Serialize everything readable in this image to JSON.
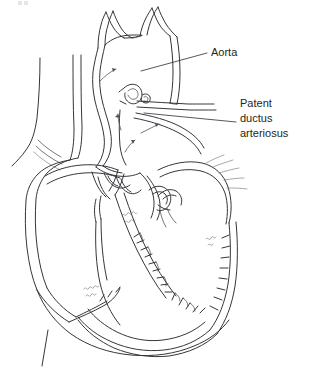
{
  "figure": {
    "title": "Patent ductus arteriosus",
    "kind": "anatomical-line-drawing",
    "background_color": "#ffffff",
    "ink_color": "#37353a",
    "label_color": "#231f20",
    "width": 311,
    "height": 369
  },
  "labels": [
    {
      "id": "aorta",
      "lines": [
        "Aorta"
      ],
      "text": "Aorta",
      "x": 211,
      "y": 53,
      "leader_from": [
        141,
        71
      ],
      "leader_to": [
        207,
        53
      ]
    },
    {
      "id": "patent-ductus-arteriosus",
      "lines": [
        "Patent",
        "ductus",
        "arteriosus"
      ],
      "text": "Patent ductus arteriosus",
      "x": 240,
      "y": 104,
      "leader_from": [
        144,
        113
      ],
      "leader_to": [
        236,
        122
      ]
    }
  ],
  "label_text": {
    "aorta": "Aorta",
    "pda_line1": "Patent",
    "pda_line2": "ductus",
    "pda_line3": "arteriosus"
  },
  "structures": [
    {
      "id": "aortic-arch",
      "name": "Aortic arch"
    },
    {
      "id": "brachiocephalic-trunk",
      "name": "Brachiocephalic trunk"
    },
    {
      "id": "left-common-carotid",
      "name": "Left common carotid artery"
    },
    {
      "id": "left-subclavian",
      "name": "Left subclavian artery"
    },
    {
      "id": "descending-aorta",
      "name": "Descending aorta"
    },
    {
      "id": "ascending-aorta",
      "name": "Ascending aorta"
    },
    {
      "id": "superior-vena-cava",
      "name": "Superior vena cava"
    },
    {
      "id": "pulmonary-artery",
      "name": "Pulmonary artery"
    },
    {
      "id": "ductus-arteriosus",
      "name": "Patent ductus arteriosus opening"
    },
    {
      "id": "right-atrium",
      "name": "Right atrium"
    },
    {
      "id": "left-atrium",
      "name": "Left atrium"
    },
    {
      "id": "right-ventricle",
      "name": "Right ventricle"
    },
    {
      "id": "left-ventricle",
      "name": "Left ventricle"
    },
    {
      "id": "interventricular-septum",
      "name": "Interventricular septum"
    },
    {
      "id": "aortic-valve",
      "name": "Aortic valve leaflets"
    },
    {
      "id": "mitral-valve",
      "name": "Mitral valve leaflets"
    },
    {
      "id": "tricuspid-valve",
      "name": "Tricuspid valve leaflets"
    }
  ],
  "flow_arrows": [
    {
      "id": "arrow-ascending-aorta",
      "description": "flow up the ascending aorta into arch"
    },
    {
      "id": "arrow-pda-shunt-left",
      "description": "shunt flow from aorta through ductus"
    },
    {
      "id": "arrow-pulmonary-right",
      "description": "flow into pulmonary artery"
    },
    {
      "id": "arrow-pulmonary-lower",
      "description": "flow in pulmonary outflow tract"
    }
  ]
}
